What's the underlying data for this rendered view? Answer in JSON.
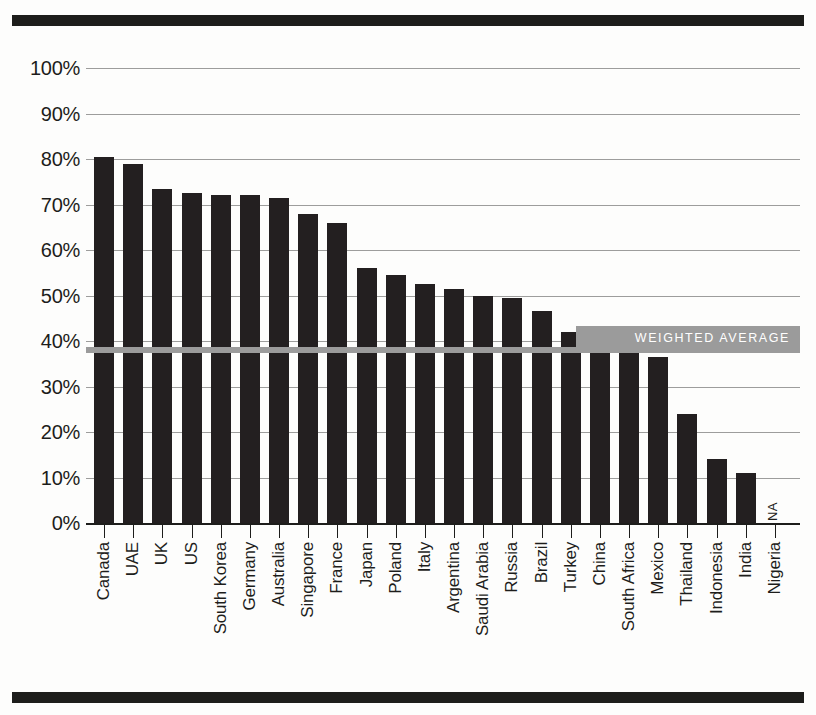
{
  "chart_data": {
    "type": "bar",
    "title": "",
    "subtitle": "",
    "xlabel": "",
    "ylabel": "",
    "ylim": [
      0,
      100
    ],
    "grid": true,
    "legend_position": "none",
    "ytick_labels": [
      "100%",
      "90%",
      "80%",
      "70%",
      "60%",
      "50%",
      "40%",
      "30%",
      "20%",
      "10%",
      "0%"
    ],
    "ytick_values": [
      100,
      90,
      80,
      70,
      60,
      50,
      40,
      30,
      20,
      10,
      0
    ],
    "categories": [
      "Canada",
      "UAE",
      "UK",
      "US",
      "South Korea",
      "Germany",
      "Australia",
      "Singapore",
      "France",
      "Japan",
      "Poland",
      "Italy",
      "Argentina",
      "Saudi Arabia",
      "Russia",
      "Brazil",
      "Turkey",
      "China",
      "South Africa",
      "Mexico",
      "Thailand",
      "Indonesia",
      "India",
      "Nigeria"
    ],
    "values": [
      80.5,
      79,
      73.5,
      72.5,
      72,
      72,
      71.5,
      68,
      66,
      56,
      54.5,
      52.5,
      51.5,
      50,
      49.5,
      46.5,
      42,
      40.5,
      38.5,
      36.5,
      24,
      14,
      11,
      null
    ],
    "value_labels": [
      "",
      "",
      "",
      "",
      "",
      "",
      "",
      "",
      "",
      "",
      "",
      "",
      "",
      "",
      "",
      "",
      "",
      "",
      "",
      "",
      "",
      "",
      "",
      "NA"
    ],
    "annotations": [
      {
        "name": "weighted-average",
        "label": "WEIGHTED AVERAGE",
        "value": 38
      }
    ],
    "colors": {
      "bar": "#231f20",
      "average_line": "#9b9b9b",
      "gridline": "#9d9d9c",
      "axis": "#1d1d1b",
      "rule": "#1d1d1b",
      "background": "#fdfdfc",
      "badge_text": "#ffffff"
    }
  }
}
